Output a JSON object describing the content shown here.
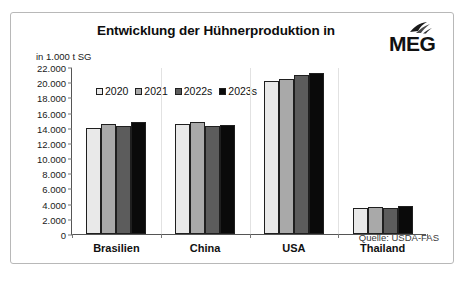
{
  "card": {
    "title": "Entwicklung der Hühnerproduktion in",
    "axis_unit": "in 1.000 t SG",
    "source": "Quelle: USDA-FAS",
    "logo_text": "MEG",
    "logo_icon": "bird-wing-icon"
  },
  "chart_data": {
    "type": "bar",
    "title": "Entwicklung der Hühnerproduktion in",
    "xlabel": "",
    "ylabel": "in 1.000 t SG",
    "ylim": [
      0,
      22000
    ],
    "ytick_step": 2000,
    "yticks": [
      "22.000",
      "20.000",
      "18.000",
      "16.000",
      "14.000",
      "12.000",
      "10.000",
      "8.000",
      "6.000",
      "4.000",
      "2.000",
      "0"
    ],
    "grid": false,
    "legend_position": "top-left-inside",
    "categories": [
      "Brasilien",
      "China",
      "USA",
      "Thailand"
    ],
    "series": [
      {
        "name": "2020",
        "color": "#e9e9e9",
        "values": [
          14000,
          14500,
          20200,
          3450
        ]
      },
      {
        "name": "2021",
        "color": "#a9a9a9",
        "values": [
          14550,
          14700,
          20450,
          3500
        ]
      },
      {
        "name": "2022s",
        "color": "#5c5c5c",
        "values": [
          14250,
          14250,
          21000,
          3480
        ]
      },
      {
        "name": "2023s",
        "color": "#0a0a0a",
        "values": [
          14750,
          14400,
          21250,
          3700
        ]
      }
    ]
  }
}
